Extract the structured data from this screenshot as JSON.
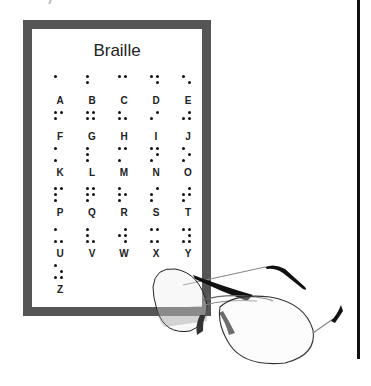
{
  "card": {
    "title": "Braille",
    "frame_color": "#555555"
  },
  "letters": [
    {
      "label": "A",
      "dots": [
        1
      ]
    },
    {
      "label": "B",
      "dots": [
        1,
        2
      ]
    },
    {
      "label": "C",
      "dots": [
        1,
        4
      ]
    },
    {
      "label": "D",
      "dots": [
        1,
        4,
        5
      ]
    },
    {
      "label": "E",
      "dots": [
        1,
        5
      ]
    },
    {
      "label": "F",
      "dots": [
        1,
        2,
        4
      ]
    },
    {
      "label": "G",
      "dots": [
        1,
        2,
        4,
        5
      ]
    },
    {
      "label": "H",
      "dots": [
        1,
        2,
        5
      ]
    },
    {
      "label": "I",
      "dots": [
        2,
        4
      ]
    },
    {
      "label": "J",
      "dots": [
        2,
        4,
        5
      ]
    },
    {
      "label": "K",
      "dots": [
        1,
        3
      ]
    },
    {
      "label": "L",
      "dots": [
        1,
        2,
        3
      ]
    },
    {
      "label": "M",
      "dots": [
        1,
        3,
        4
      ]
    },
    {
      "label": "N",
      "dots": [
        1,
        3,
        4,
        5
      ]
    },
    {
      "label": "O",
      "dots": [
        1,
        3,
        5
      ]
    },
    {
      "label": "P",
      "dots": [
        1,
        2,
        3,
        4
      ]
    },
    {
      "label": "Q",
      "dots": [
        1,
        2,
        3,
        4,
        5
      ]
    },
    {
      "label": "R",
      "dots": [
        1,
        2,
        3,
        5
      ]
    },
    {
      "label": "S",
      "dots": [
        2,
        3,
        4
      ]
    },
    {
      "label": "T",
      "dots": [
        2,
        3,
        4,
        5
      ]
    },
    {
      "label": "U",
      "dots": [
        1,
        3,
        6
      ]
    },
    {
      "label": "V",
      "dots": [
        1,
        2,
        3,
        6
      ]
    },
    {
      "label": "W",
      "dots": [
        2,
        4,
        5,
        6
      ]
    },
    {
      "label": "X",
      "dots": [
        1,
        3,
        4,
        6
      ]
    },
    {
      "label": "Y",
      "dots": [
        1,
        3,
        4,
        5,
        6
      ]
    },
    {
      "label": "Z",
      "dots": [
        1,
        3,
        5,
        6
      ]
    }
  ],
  "illustration": {
    "object": "aviator-eyeglasses"
  }
}
